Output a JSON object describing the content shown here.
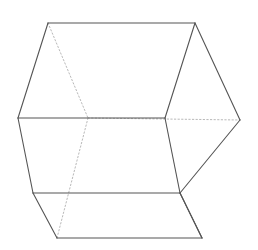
{
  "figure": {
    "name": "wireframe-cube",
    "canvas": {
      "width": 258,
      "height": 250,
      "background": "#ffffff"
    },
    "style": {
      "visible_edge_color": "#555555",
      "hidden_edge_color": "#b9b9b9",
      "visible_edge_width": 1.1,
      "hidden_edge_width": 1.0,
      "hidden_dash_pattern": "1.4 2.2"
    },
    "vertices": {
      "top_left": {
        "x": 48,
        "y": 23
      },
      "top_right": {
        "x": 195,
        "y": 23
      },
      "far_left": {
        "x": 18,
        "y": 118
      },
      "far_right": {
        "x": 240,
        "y": 120
      },
      "center_hidden": {
        "x": 88,
        "y": 118
      },
      "center_right": {
        "x": 165,
        "y": 118
      },
      "mid_left_low": {
        "x": 33,
        "y": 193
      },
      "mid_right_low": {
        "x": 180,
        "y": 193
      },
      "bottom_left": {
        "x": 57,
        "y": 238
      },
      "bottom_right": {
        "x": 202,
        "y": 238
      }
    },
    "visible_edges": [
      {
        "name": "top-edge",
        "from": "top_left",
        "to": "top_right"
      },
      {
        "name": "upper-left-edge",
        "from": "top_left",
        "to": "far_left"
      },
      {
        "name": "upper-right-edge",
        "from": "top_right",
        "to": "far_right"
      },
      {
        "name": "lower-left-silhouette",
        "from": "far_left",
        "to": "mid_left_low"
      },
      {
        "name": "left-corner-edge",
        "from": "mid_left_low",
        "to": "bottom_left"
      },
      {
        "name": "bottom-edge",
        "from": "bottom_left",
        "to": "bottom_right"
      },
      {
        "name": "right-corner-edge",
        "from": "bottom_right",
        "to": "mid_right_low"
      },
      {
        "name": "lower-right-silhouette",
        "from": "mid_right_low",
        "to": "far_right"
      },
      {
        "name": "front-top-horizontal",
        "from": "far_left",
        "to": "center_right"
      },
      {
        "name": "front-bottom-horizontal",
        "from": "mid_left_low",
        "to": "mid_right_low"
      },
      {
        "name": "front-vertical-right",
        "from": "center_right",
        "to": "mid_right_low"
      },
      {
        "name": "front-upper-right-edge",
        "from": "center_right",
        "to": "top_right"
      },
      {
        "name": "front-lower-right-edge",
        "from": "mid_right_low",
        "to": "bottom_right"
      }
    ],
    "hidden_edges": [
      {
        "name": "hidden-upper-diagonal",
        "from": "top_left",
        "to": "center_hidden"
      },
      {
        "name": "hidden-horizontal",
        "from": "center_hidden",
        "to": "far_right"
      },
      {
        "name": "hidden-lower-diagonal",
        "from": "center_hidden",
        "to": "bottom_left"
      }
    ]
  }
}
